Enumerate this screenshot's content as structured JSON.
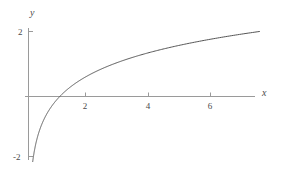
{
  "figure": {
    "background_color": "#ffffff",
    "axis_color": "#9a9a9a",
    "curve_color": "#555555",
    "text_color": "#4a4a4a"
  },
  "chart_data": {
    "type": "line",
    "title": "",
    "subtitle": "",
    "xlabel": "x",
    "ylabel": "y",
    "function": "y = ln(x)",
    "grid": false,
    "legend": null,
    "xlim": [
      -0.1,
      7.45
    ],
    "ylim": [
      -2.1,
      2.25
    ],
    "xticks": [
      2,
      4,
      6
    ],
    "xtick_labels": [
      "2",
      "4",
      "6"
    ],
    "yticks": [
      2
    ],
    "ytick_labels": [
      "2"
    ],
    "extra_yticks": [
      -2
    ],
    "extra_ytick_labels": [
      "-2"
    ],
    "series": [
      {
        "name": "ln(x)",
        "x": [
          0.135,
          0.18,
          0.25,
          0.33,
          0.45,
          0.6,
          0.8,
          1.0,
          1.25,
          1.6,
          2.0,
          2.5,
          3.0,
          3.5,
          4.0,
          4.5,
          5.0,
          5.5,
          6.0,
          6.5,
          7.0,
          7.39
        ],
        "y": [
          -2.0,
          -1.71,
          -1.39,
          -1.11,
          -0.8,
          -0.51,
          -0.22,
          0.0,
          0.22,
          0.47,
          0.69,
          0.92,
          1.1,
          1.25,
          1.39,
          1.5,
          1.61,
          1.7,
          1.79,
          1.87,
          1.95,
          2.0
        ]
      }
    ]
  },
  "axes": {
    "x_axis_label": "x",
    "y_axis_label": "y",
    "x_tick_2": "2",
    "x_tick_4": "4",
    "x_tick_6": "6",
    "y_tick_2": "2",
    "y_tick_neg2": "-2"
  }
}
